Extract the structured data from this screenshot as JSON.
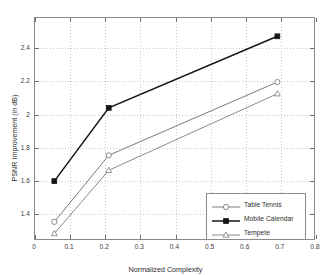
{
  "chart_data": {
    "type": "line",
    "title": "",
    "xlabel": "Normalized Complexity",
    "ylabel": "PSNR Improvement (in dB)",
    "xlim": [
      0,
      0.8
    ],
    "ylim": [
      1.24,
      2.58
    ],
    "xticks": [
      0,
      0.1,
      0.2,
      0.3,
      0.4,
      0.5,
      0.6,
      0.7,
      0.8
    ],
    "xticklabels": [
      "0",
      "0.1",
      "0.2",
      "0.3",
      "0.4",
      "0.5",
      "0.6",
      "0.7",
      "0.8"
    ],
    "yticks": [
      1.4,
      1.6,
      1.8,
      2.0,
      2.2,
      2.4
    ],
    "yticklabels": [
      "1.4",
      "1.6",
      "1.8",
      "2",
      "2.2",
      "2.4"
    ],
    "grid": true,
    "legend_position": "lower right",
    "x": [
      0.055,
      0.21,
      0.69
    ],
    "series": [
      {
        "name": "Table Tennis",
        "marker": "circle-open",
        "color": "#7a7a7a",
        "values": [
          1.355,
          1.755,
          2.195
        ]
      },
      {
        "name": "Mobile Calendar",
        "marker": "square-filled",
        "color": "#151515",
        "values": [
          1.6,
          2.04,
          2.47
        ]
      },
      {
        "name": "Tempete",
        "marker": "triangle-open",
        "color": "#8a8a8a",
        "values": [
          1.285,
          1.665,
          2.125
        ]
      }
    ]
  },
  "legend": {
    "entries": [
      "Table Tennis",
      "Mobile Calendar",
      "Tempete"
    ]
  }
}
